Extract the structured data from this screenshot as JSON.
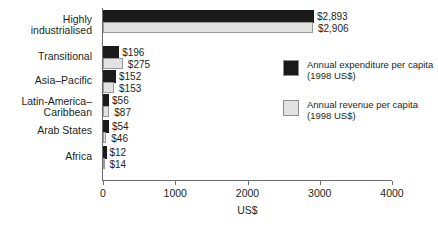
{
  "chart_data": {
    "type": "bar",
    "title": "",
    "subtitle": "",
    "orientation": "horizontal",
    "grouped": true,
    "xlabel": "US$",
    "ylabel": "",
    "xlim": [
      0,
      4000
    ],
    "xticks": [
      0,
      1000,
      2000,
      3000,
      4000
    ],
    "xtick_labels": [
      "0",
      "1000",
      "2000",
      "3000",
      "4000"
    ],
    "grid": false,
    "legend_position": "right",
    "categories": [
      "Highly\nindustrialised",
      "Transitional",
      "Asia–Pacific",
      "Latin-America–\nCaribbean",
      "Arab States",
      "Africa"
    ],
    "series": [
      {
        "name": "Annual expenditure per capita\n(1998 US$)",
        "color": "#1a1a1a",
        "values": [
          2893,
          196,
          152,
          56,
          54,
          12
        ],
        "value_labels": [
          "$2,893",
          "$196",
          "$152",
          "$56",
          "$54",
          "$12"
        ]
      },
      {
        "name": "Annual revenue per capita\n(1998 US$)",
        "color": "#e2e2e2",
        "values": [
          2906,
          275,
          153,
          87,
          46,
          14
        ],
        "value_labels": [
          "$2,906",
          "$275",
          "$153",
          "$87",
          "$46",
          "$14"
        ]
      }
    ]
  },
  "legend": {
    "items": [
      {
        "label": "Annual expenditure per capita\n(1998 US$)",
        "swatch": "expenditure"
      },
      {
        "label": "Annual revenue per capita\n(1998 US$)",
        "swatch": "revenue"
      }
    ]
  },
  "axis": {
    "x_title": "US$"
  }
}
